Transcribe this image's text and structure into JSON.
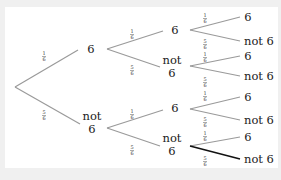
{
  "diagram": {
    "type": "probability-tree",
    "root": {
      "x": 15,
      "y": 87
    },
    "line_color": "#9a9a9a",
    "highlight_color": "#111111",
    "level1": [
      {
        "label_lines": [
          "6"
        ],
        "x": 91,
        "y": 53,
        "edge_end": [
          78,
          50
        ],
        "prob": [
          "1",
          "6"
        ],
        "prob_pos": [
          44,
          56
        ]
      },
      {
        "label_lines": [
          "not",
          "6"
        ],
        "x": 92,
        "y": 122,
        "edge_end": [
          80,
          124
        ],
        "prob": [
          "5",
          "6"
        ],
        "prob_pos": [
          44,
          115
        ]
      }
    ],
    "level2": [
      {
        "label_lines": [
          "6"
        ],
        "x": 175,
        "y": 34,
        "from": [
          107,
          49
        ],
        "edge_end": [
          163,
          31
        ],
        "prob": [
          "1",
          "6"
        ],
        "prob_pos": [
          132,
          34
        ]
      },
      {
        "label_lines": [
          "not",
          "6"
        ],
        "x": 172,
        "y": 64,
        "from": [
          107,
          49
        ],
        "edge_end": [
          160,
          67
        ],
        "prob": [
          "5",
          "6"
        ],
        "prob_pos": [
          132,
          70
        ]
      },
      {
        "label_lines": [
          "6"
        ],
        "x": 175,
        "y": 112,
        "from": [
          107,
          128
        ],
        "edge_end": [
          163,
          110
        ],
        "prob": [
          "1",
          "6"
        ],
        "prob_pos": [
          132,
          114
        ]
      },
      {
        "label_lines": [
          "not",
          "6"
        ],
        "x": 172,
        "y": 142,
        "from": [
          107,
          128
        ],
        "edge_end": [
          160,
          146
        ],
        "prob": [
          "5",
          "6"
        ],
        "prob_pos": [
          132,
          150
        ]
      }
    ],
    "level3": [
      {
        "label": "6",
        "x": 248,
        "y": 21,
        "from": [
          190,
          30
        ],
        "edge_end": [
          240,
          17
        ],
        "prob": [
          "1",
          "6"
        ],
        "prob_pos": [
          205,
          18
        ],
        "highlight": false
      },
      {
        "label": "not 6",
        "x": 244,
        "y": 45,
        "from": [
          190,
          30
        ],
        "edge_end": [
          240,
          41
        ],
        "prob": [
          "5",
          "6"
        ],
        "prob_pos": [
          205,
          44
        ],
        "highlight": false
      },
      {
        "label": "6",
        "x": 248,
        "y": 60,
        "from": [
          190,
          66
        ],
        "edge_end": [
          240,
          56
        ],
        "prob": [
          "1",
          "6"
        ],
        "prob_pos": [
          205,
          57
        ],
        "highlight": false
      },
      {
        "label": "not 6",
        "x": 244,
        "y": 80,
        "from": [
          190,
          66
        ],
        "edge_end": [
          240,
          76
        ],
        "prob": [
          "5",
          "6"
        ],
        "prob_pos": [
          205,
          82
        ],
        "highlight": false
      },
      {
        "label": "6",
        "x": 248,
        "y": 101,
        "from": [
          190,
          109
        ],
        "edge_end": [
          240,
          97
        ],
        "prob": [
          "1",
          "6"
        ],
        "prob_pos": [
          205,
          96
        ],
        "highlight": false
      },
      {
        "label": "not 6",
        "x": 244,
        "y": 124,
        "from": [
          190,
          109
        ],
        "edge_end": [
          240,
          120
        ],
        "prob": [
          "5",
          "6"
        ],
        "prob_pos": [
          205,
          122
        ],
        "highlight": false
      },
      {
        "label": "6",
        "x": 248,
        "y": 141,
        "from": [
          190,
          146
        ],
        "edge_end": [
          240,
          137
        ],
        "prob": [
          "1",
          "6"
        ],
        "prob_pos": [
          205,
          136
        ],
        "highlight": false
      },
      {
        "label": "not 6",
        "x": 244,
        "y": 163,
        "from": [
          190,
          146
        ],
        "edge_end": [
          240,
          159
        ],
        "prob": [
          "5",
          "6"
        ],
        "prob_pos": [
          205,
          161
        ],
        "highlight": true
      }
    ]
  }
}
